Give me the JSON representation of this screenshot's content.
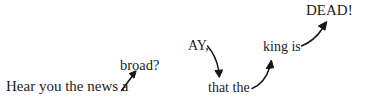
{
  "diagram": {
    "type": "annotated-sentence-arrow-chain",
    "background_color": "#ffffff",
    "text_color": "#1c1c1c",
    "arrow_color": "#151515",
    "fragments": [
      {
        "id": "hear-you-the-news-a",
        "text": "Hear you the news a",
        "order": 1
      },
      {
        "id": "broad",
        "text": "broad?",
        "order": 2
      },
      {
        "id": "ay",
        "text": "AY,",
        "order": 3
      },
      {
        "id": "that-the",
        "text": "that the",
        "order": 4
      },
      {
        "id": "king-is",
        "text": "king is",
        "order": 5
      },
      {
        "id": "dead",
        "text": "DEAD!",
        "order": 6
      }
    ],
    "full_sentence": "Hear you the news a broad? AY, that the king is DEAD!",
    "arrows": [
      {
        "id": "arrow-a-to-broad",
        "from": "hear-you-the-news-a",
        "to": "broad",
        "shape": "straight",
        "direction": "up-right"
      },
      {
        "id": "arrow-ay-to-that-the",
        "from": "ay",
        "to": "that-the",
        "shape": "curved",
        "direction": "down"
      },
      {
        "id": "arrow-that-the-to-king-is",
        "from": "that-the",
        "to": "king-is",
        "shape": "curved",
        "direction": "up"
      },
      {
        "id": "arrow-king-is-to-dead",
        "from": "king-is",
        "to": "dead",
        "shape": "curved",
        "direction": "up-right"
      }
    ]
  }
}
